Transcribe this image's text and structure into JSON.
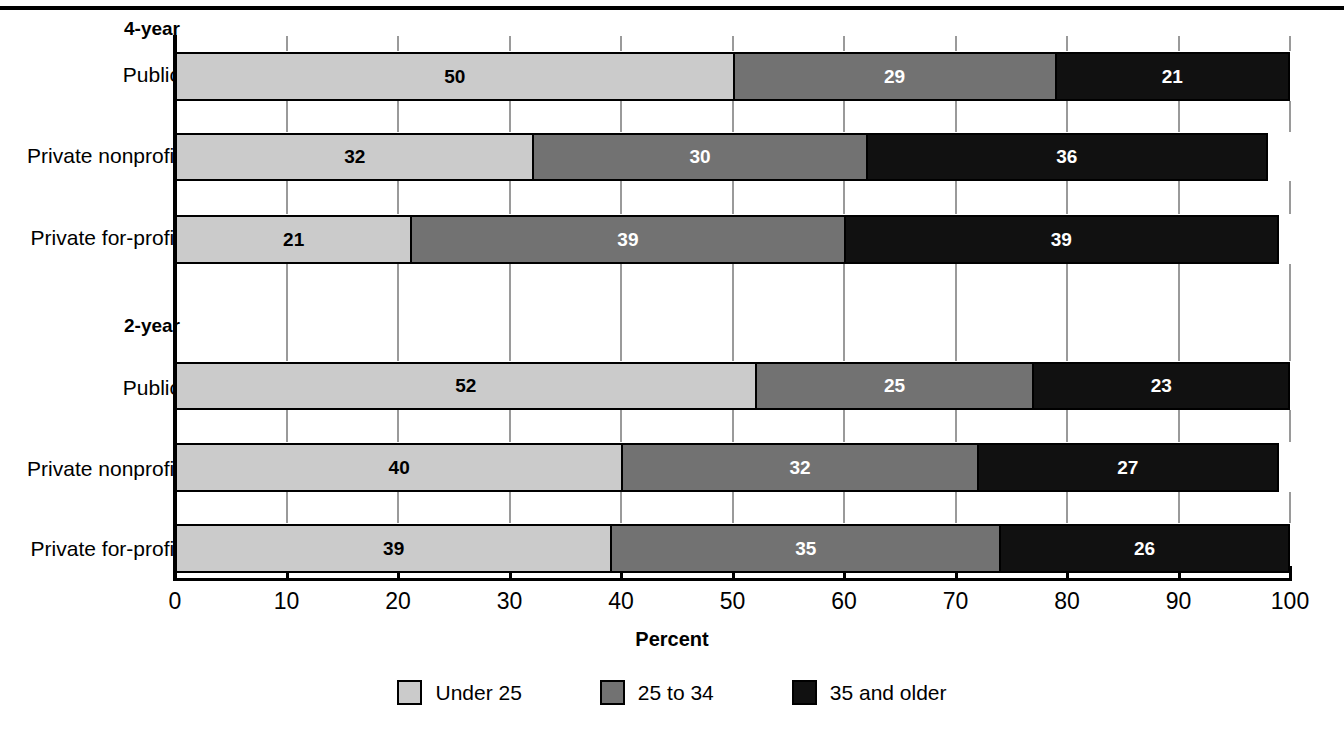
{
  "chart_data": {
    "type": "bar",
    "orientation": "horizontal",
    "stacked": true,
    "title": "",
    "xlabel": "Percent",
    "ylabel": "",
    "xlim": [
      0,
      100
    ],
    "xticks": [
      0,
      10,
      20,
      30,
      40,
      50,
      60,
      70,
      80,
      90,
      100
    ],
    "xticklabels": [
      "0",
      "10",
      "20",
      "30",
      "40",
      "50",
      "60",
      "70",
      "80",
      "90",
      "100"
    ],
    "grid": true,
    "legend_position": "bottom-center",
    "legend": [
      "Under 25",
      "25 to 34",
      "35 and older"
    ],
    "series": [
      {
        "name": "Under 25",
        "color": "#cbcbcb",
        "values": [
          50,
          32,
          21,
          52,
          40,
          39
        ]
      },
      {
        "name": "25 to 34",
        "color": "#727272",
        "values": [
          29,
          30,
          39,
          25,
          32,
          35
        ]
      },
      {
        "name": "35 and older",
        "color": "#111111",
        "values": [
          21,
          36,
          39,
          23,
          27,
          26
        ]
      }
    ],
    "categories": [
      "Public",
      "Private nonprofit",
      "Private for-profit",
      "Public",
      "Private nonprofit",
      "Private for-profit"
    ],
    "groups": [
      {
        "label": "4-year",
        "rows": [
          {
            "category": "Public",
            "segments": [
              50,
              29,
              21
            ]
          },
          {
            "category": "Private nonprofit",
            "segments": [
              32,
              30,
              36
            ]
          },
          {
            "category": "Private for-profit",
            "segments": [
              21,
              39,
              39
            ]
          }
        ]
      },
      {
        "label": "2-year",
        "rows": [
          {
            "category": "Public",
            "segments": [
              52,
              25,
              23
            ]
          },
          {
            "category": "Private nonprofit",
            "segments": [
              40,
              32,
              27
            ]
          },
          {
            "category": "Private for-profit",
            "segments": [
              39,
              35,
              26
            ]
          }
        ]
      }
    ]
  },
  "groups": {
    "g0": {
      "label": "4-year"
    },
    "g1": {
      "label": "2-year"
    }
  },
  "rows": {
    "r0": {
      "label": "Public",
      "v0": "50",
      "v1": "29",
      "v2": "21"
    },
    "r1": {
      "label": "Private nonprofit",
      "v0": "32",
      "v1": "30",
      "v2": "36"
    },
    "r2": {
      "label": "Private for-profit",
      "v0": "21",
      "v1": "39",
      "v2": "39"
    },
    "r3": {
      "label": "Public",
      "v0": "52",
      "v1": "25",
      "v2": "23"
    },
    "r4": {
      "label": "Private nonprofit",
      "v0": "40",
      "v1": "32",
      "v2": "27"
    },
    "r5": {
      "label": "Private for-profit",
      "v0": "39",
      "v1": "35",
      "v2": "26"
    }
  },
  "axis": {
    "title": "Percent",
    "ticks": [
      "0",
      "10",
      "20",
      "30",
      "40",
      "50",
      "60",
      "70",
      "80",
      "90",
      "100"
    ]
  },
  "legend": {
    "items": [
      {
        "label": "Under 25",
        "color": "#cbcbcb"
      },
      {
        "label": "25 to 34",
        "color": "#727272"
      },
      {
        "label": "35 and older",
        "color": "#111111"
      }
    ]
  }
}
